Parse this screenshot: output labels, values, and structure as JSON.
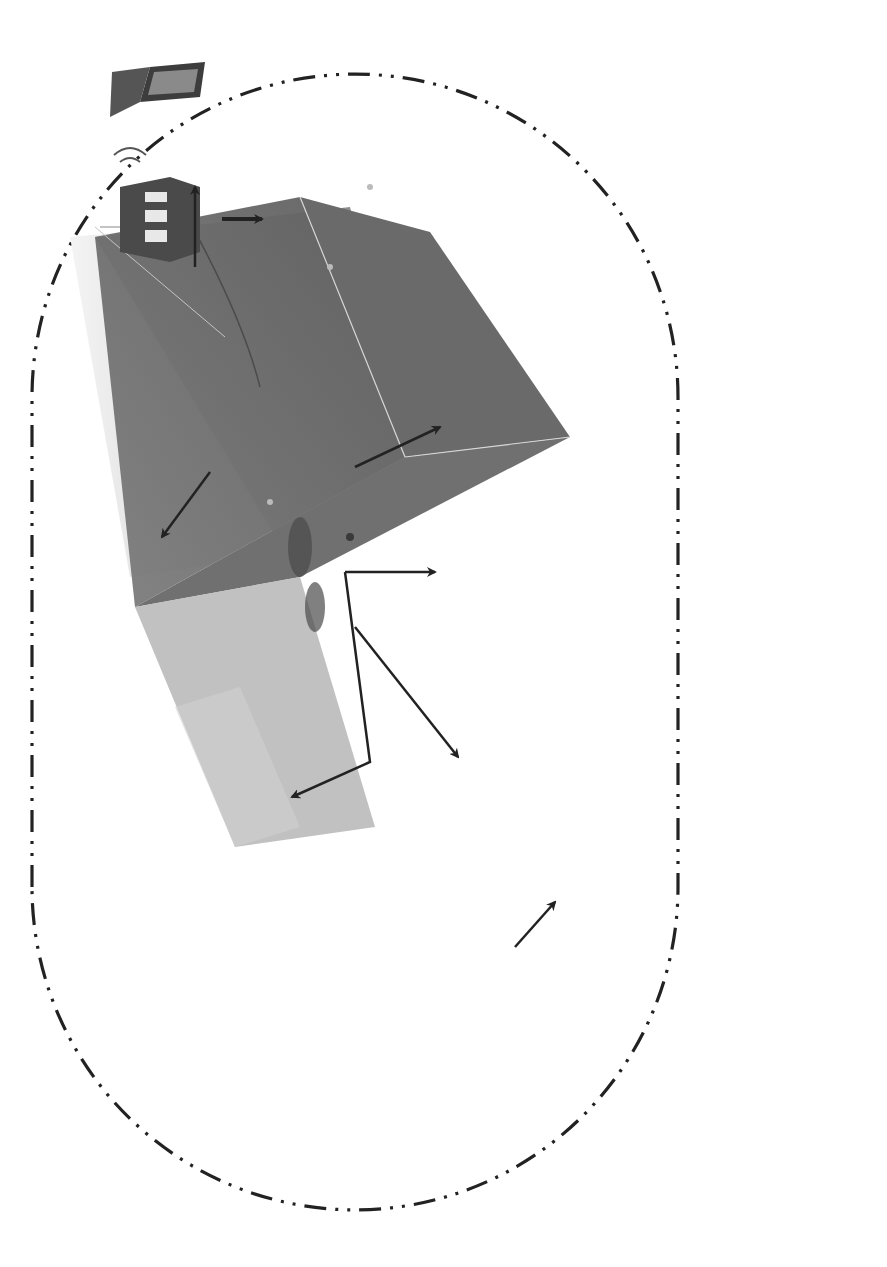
{
  "figure": {
    "orientation": "rotated-90-ccw",
    "colors": {
      "line": "#222222",
      "scene_dark": "#6f6f6f",
      "scene_mid": "#8a8a8a",
      "scene_light": "#c9c9c9",
      "text": "#333333"
    }
  },
  "scene": {
    "labels": {
      "shore_station": "Shore station",
      "shore_station_fr": "Station cotiere",
      "network": "Network",
      "network_fr": "Reseau",
      "junction_box": "Junction box",
      "junction_box_fr": "boite de jonction",
      "camera": "Camera",
      "other_sensors": "Other sensors",
      "other_sensors_fr": "autres capteurs",
      "adcp": "ADCP",
      "tests": "Tests",
      "acoustic_array": "Acoustic array",
      "acoustic_array_fr": "pack acoustique"
    },
    "icons": [
      "shore-station-building-icon",
      "wireless-signal-icon",
      "laptop-network-icon"
    ]
  },
  "video": {
    "title": "Video",
    "items": [
      "Near-structure monitoring",
      "Visual identification"
    ]
  },
  "video_output": {
    "items": [
      "Event detection",
      "Image segmentation"
    ]
  },
  "hydrophones": {
    "title": "Hydrophones",
    "items": [
      "Ambient noise",
      "Mammals’ sounds",
      "Anthropic activities"
    ]
  },
  "hydrophones_output": {
    "items": [
      "Noise estimation level",
      "Wave and weather detection",
      "Dolphin whistles detection",
      "Whale  sound detection",
      "Vessel detection"
    ]
  },
  "adcp": {
    "title": "ADCP",
    "items": [
      {
        "line1": "Current monitoring"
      },
      {
        "line1": "Water column",
        "line2": "backscatter monitoring"
      }
    ]
  },
  "adcp_output": {
    "items": [
      {
        "line1": "Current estimation"
      },
      {
        "line1": "Echo-integration of",
        "line2": "backscattering signal"
      }
    ]
  },
  "other_sensors": {
    "title": "Other sensors:",
    "items": [
      {
        "line1": "Benthic ecosystem monitoring"
      },
      {
        "line1": "Seafloor characterization"
      },
      {
        "line1": "Thermometer"
      },
      {
        "line1": "Pressure detection"
      },
      {
        "line1": "Salinity"
      },
      {
        "line1": "Turbidity"
      },
      {
        "line1": "Dissolved oxygen concentration"
      },
      {
        "line1": "Concentration of nitrate,",
        "line2": "phosphate, silicon, etc."
      }
    ]
  },
  "other_sensors_output": {
    "items": [
      "Seafloor classification",
      "other methodologies"
    ]
  },
  "fisheries": {
    "title": "Fisheries echossounders",
    "items": [
      {
        "line1": "Water column monitoring",
        "line2": "(algae, bubbles)"
      },
      {
        "line1": "Schools of fish",
        "line2": "characterization"
      }
    ]
  },
  "fisheries_output": {
    "items": [
      {
        "line1": "Echo-integration  of",
        "line2": "backscattering signal"
      },
      {
        "line1": "Inverse modeling"
      }
    ]
  },
  "cytometers": {
    "title_line1": "Cytometers and underwater",
    "title_line2": "vision profiler",
    "items": [
      "Zooplankton characterization",
      "Phytoplankton characterization"
    ]
  },
  "pipeline": {
    "observatory": {
      "line1": "Underwater",
      "line2": "observatory:",
      "line3": "Data collecting"
    },
    "signal": {
      "line1": "Signal and",
      "line2": "image"
    },
    "fusion": {
      "line1": "Data or information fusion",
      "line2": "underwater ecosystem",
      "line3": "monitoring"
    }
  }
}
